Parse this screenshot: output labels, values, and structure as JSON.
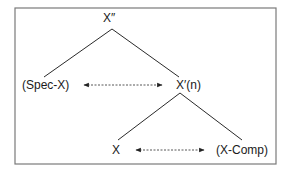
{
  "diagram": {
    "type": "x-bar-tree",
    "frame": {
      "border_color": "#7a7a7a",
      "line_color": "#2a2a2a"
    },
    "nodes": {
      "root": {
        "label": "X″"
      },
      "spec": {
        "label": "(Spec-X)"
      },
      "xbar": {
        "label": "X′(n)"
      },
      "head": {
        "label": "X"
      },
      "comp": {
        "label": "(X-Comp)"
      }
    },
    "edges": [
      {
        "from": "root",
        "to": "spec"
      },
      {
        "from": "root",
        "to": "xbar"
      },
      {
        "from": "xbar",
        "to": "head"
      },
      {
        "from": "xbar",
        "to": "comp"
      }
    ],
    "relations": [
      {
        "between": [
          "spec",
          "xbar"
        ],
        "style": "dashed-double-arrow"
      },
      {
        "between": [
          "head",
          "comp"
        ],
        "style": "dashed-double-arrow"
      }
    ]
  }
}
